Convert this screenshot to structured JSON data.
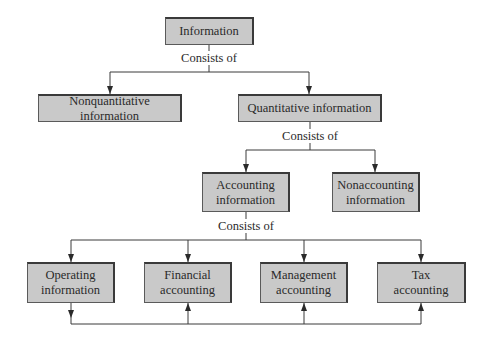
{
  "diagram": {
    "type": "hierarchy",
    "nodes": {
      "information": {
        "label": "Information"
      },
      "nonquantitative": {
        "label": "Nonquantitative information"
      },
      "quantitative": {
        "label": "Quantitative information"
      },
      "accounting": {
        "label": "Accounting information"
      },
      "nonaccounting": {
        "label": "Nonaccounting information"
      },
      "operating": {
        "label": "Operating information"
      },
      "financial": {
        "label": "Financial accounting"
      },
      "management": {
        "label": "Management accounting"
      },
      "tax": {
        "label": "Tax accounting"
      }
    },
    "edge_labels": {
      "information_to_children": "Consists of",
      "quantitative_to_children": "Consists of",
      "accounting_to_children": "Consists of"
    },
    "edges": [
      {
        "from": "information",
        "to": "nonquantitative",
        "label": "Consists of"
      },
      {
        "from": "information",
        "to": "quantitative",
        "label": "Consists of"
      },
      {
        "from": "quantitative",
        "to": "accounting",
        "label": "Consists of"
      },
      {
        "from": "quantitative",
        "to": "nonaccounting",
        "label": "Consists of"
      },
      {
        "from": "accounting",
        "to": "operating",
        "label": "Consists of"
      },
      {
        "from": "accounting",
        "to": "financial",
        "label": "Consists of"
      },
      {
        "from": "accounting",
        "to": "management",
        "label": "Consists of"
      },
      {
        "from": "accounting",
        "to": "tax",
        "label": "Consists of"
      },
      {
        "from": "operating",
        "to": "financial",
        "label": ""
      },
      {
        "from": "operating",
        "to": "management",
        "label": ""
      },
      {
        "from": "operating",
        "to": "tax",
        "label": ""
      }
    ],
    "colors": {
      "box_fill": "#c9c9c9",
      "box_border": "#3a3a3a",
      "line": "#3a3a3a"
    }
  }
}
